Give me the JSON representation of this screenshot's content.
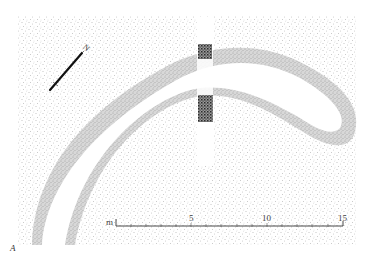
{
  "figure": {
    "label": "A",
    "type": "archaeological site plan",
    "features": [
      {
        "name": "curved ditch",
        "description": "crescent-shaped ditch with stippled sloping sides and clear base"
      },
      {
        "name": "section cut",
        "description": "vertical excavation strip crossing the ditch with hatched section fill at both ditch edges"
      },
      {
        "name": "surrounding ground",
        "description": "light stippled natural surface"
      }
    ]
  },
  "north_arrow": {
    "label": "N",
    "angle_deg": 40
  },
  "scale_bar": {
    "unit": "m",
    "labels": [
      "5",
      "10",
      "15"
    ],
    "min": 0,
    "max": 15,
    "minor_tick_interval": 1
  },
  "colors": {
    "background": "#ffffff",
    "ground_stipple": "#8a8a8a",
    "ditch_edge": "#b4b4b4",
    "section_fill": "#3a3a3a",
    "ink": "#222222"
  }
}
